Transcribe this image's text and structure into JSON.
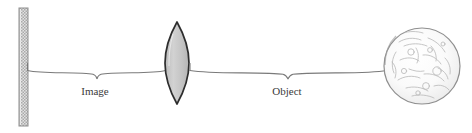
{
  "diagram": {
    "background_color": "#ffffff",
    "width": 472,
    "height": 133,
    "elements": {
      "screen": {
        "name": "screen-wall",
        "description": "hatched vertical wall / screen where the image is formed",
        "x": 19,
        "y": 8,
        "width": 9,
        "height": 118,
        "fill_color": "#d8d8d8",
        "stroke_color": "#8a8a8a",
        "hatch_color": "#9a9a9a"
      },
      "lens": {
        "name": "converging-lens",
        "description": "biconvex converging lens",
        "center_x": 177,
        "center_y": 63,
        "half_width": 12,
        "half_height": 41,
        "fill_color": "#c9c9c9",
        "stroke_color": "#2b2b2b"
      },
      "moon": {
        "name": "moon-object",
        "description": "the Moon, the object being imaged",
        "center_x": 422,
        "center_y": 66,
        "radius": 38,
        "fill_color": "#fbfbfb",
        "stroke_color": "#8f8f8f",
        "crater_color": "#b6b6b6"
      },
      "optical_axis": {
        "name": "optical-axis-line",
        "stroke_color": "#6f6f6f"
      }
    },
    "braces": [
      {
        "name": "image-distance-brace",
        "label": "Image",
        "label_x": 95,
        "label_y": 95,
        "start_x": 27,
        "end_x": 165,
        "y": 71,
        "notch_x": 97,
        "notch_depth": 8,
        "stroke_color": "#6f6f6f"
      },
      {
        "name": "object-distance-brace",
        "label": "Object",
        "label_x": 287,
        "label_y": 95,
        "start_x": 190,
        "end_x": 386,
        "y": 71,
        "notch_x": 288,
        "notch_depth": 8,
        "stroke_color": "#6f6f6f"
      }
    ]
  }
}
